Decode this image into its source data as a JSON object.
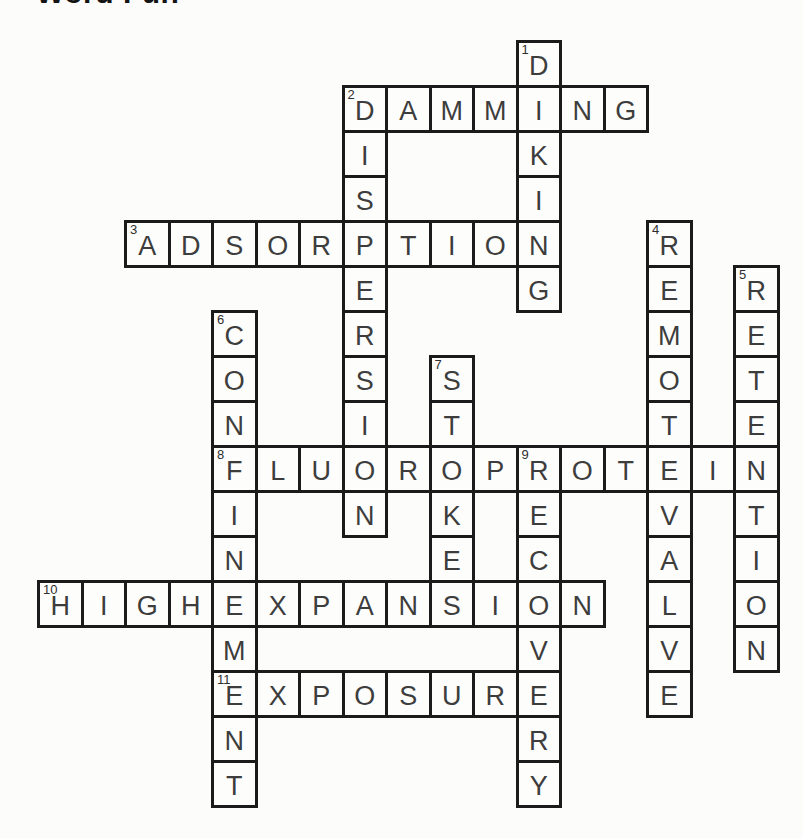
{
  "title": "Word Fun",
  "colors": {
    "paper": "#fcfcfa",
    "cell_fill": "#fdfdfc",
    "grid_line": "#1b1b1b",
    "letter": "#3d3d3d",
    "number": "#2e2e2e",
    "title": "#141414"
  },
  "puzzle": {
    "type": "crossword",
    "rows": 17,
    "cols": 17,
    "words": [
      {
        "number": 1,
        "answer": "DIKING",
        "direction": "down",
        "row": 0,
        "col": 11
      },
      {
        "number": 2,
        "answer": "DAMMING",
        "direction": "across",
        "row": 1,
        "col": 7
      },
      {
        "number": 2,
        "answer": "DISPERSION",
        "direction": "down",
        "row": 1,
        "col": 7
      },
      {
        "number": 3,
        "answer": "ADSORPTION",
        "direction": "across",
        "row": 4,
        "col": 2
      },
      {
        "number": 4,
        "answer": "REMOTEVALVE",
        "direction": "down",
        "row": 4,
        "col": 14
      },
      {
        "number": 5,
        "answer": "RETENTION",
        "direction": "down",
        "row": 5,
        "col": 16
      },
      {
        "number": 6,
        "answer": "CONFINEMENT",
        "direction": "down",
        "row": 6,
        "col": 4
      },
      {
        "number": 7,
        "answer": "STOKES",
        "direction": "down",
        "row": 7,
        "col": 9
      },
      {
        "number": 8,
        "answer": "FLUOROPROTEIN",
        "direction": "across",
        "row": 9,
        "col": 4
      },
      {
        "number": 9,
        "answer": "RECOVERY",
        "direction": "down",
        "row": 9,
        "col": 11
      },
      {
        "number": 10,
        "answer": "HIGHEXPANSION",
        "direction": "across",
        "row": 12,
        "col": 0
      },
      {
        "number": 11,
        "answer": "EXPOSURE",
        "direction": "across",
        "row": 14,
        "col": 4
      }
    ]
  }
}
